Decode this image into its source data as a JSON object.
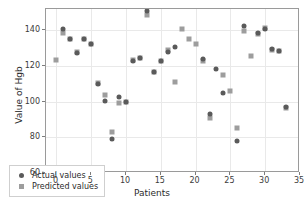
{
  "chart_data": {
    "type": "scatter",
    "title": "",
    "xlabel": "Patients",
    "ylabel": "Value of Hgb",
    "xlim": [
      -1.5,
      35
    ],
    "ylim": [
      60,
      152
    ],
    "xticks": [
      0,
      5,
      10,
      15,
      20,
      25,
      30,
      35
    ],
    "yticks": [
      60,
      80,
      100,
      120,
      140
    ],
    "grid": true,
    "legend_position": "lower left (inside axes)",
    "x": [
      0,
      1,
      2,
      3,
      4,
      5,
      6,
      7,
      8,
      9,
      10,
      11,
      12,
      13,
      14,
      15,
      16,
      17,
      18,
      19,
      20,
      21,
      22,
      23,
      24,
      25,
      26,
      27,
      28,
      29,
      30,
      31,
      32,
      33
    ],
    "series": [
      {
        "name": "Actual values",
        "marker": "circle",
        "color": "#5a5a5a",
        "values": [
          null,
          140.8,
          135.2,
          127.5,
          135.3,
          132.6,
          109.8,
          100.2,
          78.9,
          102.7,
          99.7,
          123.0,
          124.5,
          151.0,
          116.4,
          122.8,
          127.6,
          130.7,
          null,
          null,
          null,
          123.7,
          93.2,
          118.6,
          105.0,
          null,
          78.0,
          142.3,
          null,
          138.3,
          140.8,
          129.4,
          128.5,
          97.0
        ]
      },
      {
        "name": "Predicted values",
        "marker": "square",
        "color": "#9d9d9d",
        "values": [
          123.4,
          138.4,
          135.3,
          127.8,
          135.4,
          132.4,
          110.4,
          103.6,
          83.2,
          99.1,
          99.7,
          123.3,
          124.6,
          148.6,
          116.4,
          122.8,
          129.2,
          110.9,
          141.0,
          135.3,
          132.5,
          123.0,
          91.0,
          null,
          114.8,
          106.2,
          85.0,
          139.9,
          125.7,
          137.9,
          141.3,
          129.2,
          128.6,
          96.2
        ]
      }
    ]
  },
  "legend": {
    "items": [
      {
        "label": "Actual values",
        "marker": "circle"
      },
      {
        "label": "Predicted values",
        "marker": "square"
      }
    ]
  }
}
